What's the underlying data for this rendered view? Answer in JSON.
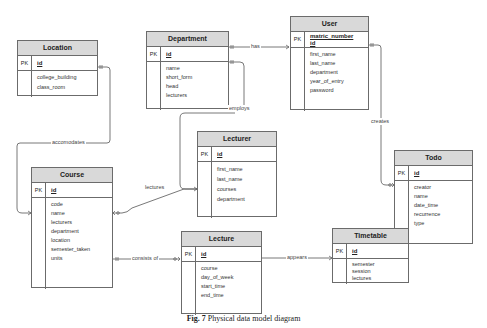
{
  "caption": {
    "label": "Fig. 7",
    "text": "Physical data model diagram"
  },
  "pk_label": "PK",
  "entities": {
    "location": {
      "name": "Location",
      "pk": "id",
      "fields": [
        "college_building",
        "class_room"
      ]
    },
    "department": {
      "name": "Department",
      "pk": "id",
      "fields": [
        "name",
        "short_form",
        "head",
        "lecturers"
      ]
    },
    "user": {
      "name": "User",
      "pk_line1": "matric_number",
      "pk_line2": "id",
      "fields": [
        "first_name",
        "last_name",
        "department",
        "year_of_entry",
        "password"
      ]
    },
    "todo": {
      "name": "Todo",
      "pk": "id",
      "fields": [
        "creator",
        "name",
        "date_time",
        "recurrence",
        "type"
      ]
    },
    "lecturer": {
      "name": "Lecturer",
      "pk": "id",
      "fields": [
        "first_name",
        "last_name",
        "courses",
        "department"
      ]
    },
    "course": {
      "name": "Course",
      "pk": "id",
      "fields": [
        "code",
        "name",
        "lecturers",
        "department",
        "location",
        "semester_taken",
        "units"
      ]
    },
    "lecture": {
      "name": "Lecture",
      "pk": "id",
      "fields": [
        "course",
        "day_of_week",
        "start_time",
        "end_time"
      ]
    },
    "timetable": {
      "name": "Timetable",
      "pk": "id",
      "fields": [
        "semester",
        "session",
        "lectures"
      ]
    }
  },
  "relationships": {
    "has": "has",
    "employs": "employs",
    "creates": "creates",
    "accomodates": "accomodates",
    "lectures": "lectures",
    "consists_of": "consists of",
    "appears": "appears"
  }
}
